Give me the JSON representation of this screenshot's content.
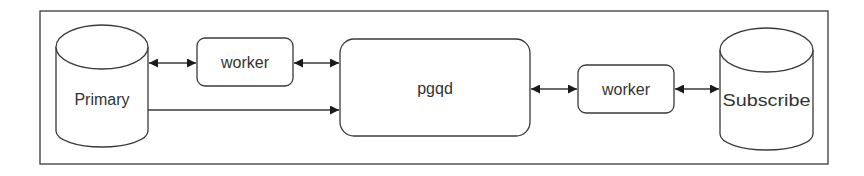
{
  "diagram": {
    "nodes": {
      "primary": {
        "label": "Primary",
        "shape": "cylinder"
      },
      "worker_left": {
        "label": "worker",
        "shape": "rounded-rect"
      },
      "pgqd": {
        "label": "pgqd",
        "shape": "rounded-rect"
      },
      "worker_right": {
        "label": "worker",
        "shape": "rounded-rect"
      },
      "subscribe": {
        "label": "Subscribe",
        "shape": "cylinder"
      }
    },
    "edges": [
      {
        "from": "primary",
        "to": "worker_left",
        "direction": "both"
      },
      {
        "from": "worker_left",
        "to": "pgqd",
        "direction": "both"
      },
      {
        "from": "primary",
        "to": "pgqd",
        "direction": "forward"
      },
      {
        "from": "pgqd",
        "to": "worker_right",
        "direction": "both"
      },
      {
        "from": "worker_right",
        "to": "subscribe",
        "direction": "both"
      }
    ],
    "colors": {
      "stroke": "#3a3a3a",
      "text": "#333333",
      "background": "#ffffff"
    }
  }
}
